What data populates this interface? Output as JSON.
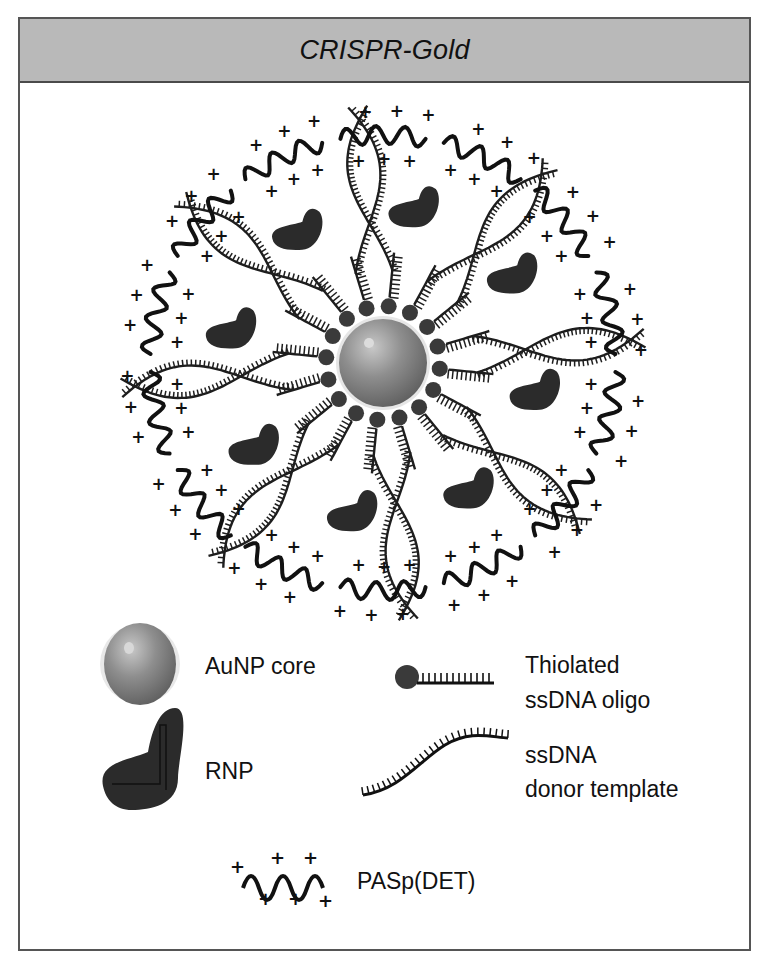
{
  "header": {
    "title": "CRISPR-Gold"
  },
  "diagram": {
    "center": {
      "x": 383,
      "y": 363
    },
    "colors": {
      "core": "#8a8a8a",
      "core_highlight": "#c4c4c4",
      "dark": "#1e1e1e",
      "rnp": "#2b2b2b",
      "frame_border": "#555555",
      "header_bg": "#b9b9b9"
    },
    "components": [
      "AuNP core",
      "Thiolated ssDNA oligo",
      "ssDNA donor template",
      "RNP",
      "PASp(DET)"
    ]
  },
  "legend": {
    "aunp": {
      "label": "AuNP core",
      "icon": "sphere-icon"
    },
    "oligo": {
      "label_line1": "Thiolated",
      "label_line2": "ssDNA oligo",
      "icon": "thiol-oligo-icon"
    },
    "rnp": {
      "label": "RNP",
      "icon": "rnp-blob-icon"
    },
    "donor": {
      "label_line1": "ssDNA",
      "label_line2": "donor template",
      "icon": "donor-strand-icon"
    },
    "paspdet": {
      "label": "PASp(DET)",
      "icon": "cationic-polymer-icon"
    }
  }
}
